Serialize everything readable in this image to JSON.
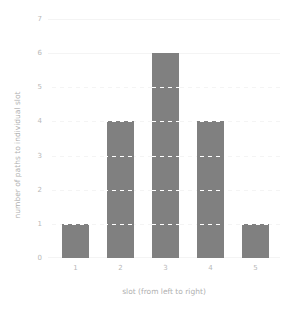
{
  "chart_data": {
    "type": "bar",
    "title": "",
    "subtitle": "",
    "categories": [
      "1",
      "2",
      "3",
      "4",
      "5"
    ],
    "values": [
      1,
      4,
      6,
      4,
      1
    ],
    "series": [
      {
        "name": "number of paths to individual slot",
        "values": [
          1,
          4,
          6,
          4,
          1
        ]
      }
    ],
    "xlabel": "slot (from left to right)",
    "ylabel": "number of paths to individual slot",
    "xtick_labels": [
      "1",
      "2",
      "3",
      "4",
      "5"
    ],
    "ytick_labels": [
      "0",
      "1",
      "2",
      "3",
      "4",
      "5",
      "6",
      "7"
    ],
    "ytick_values": [
      0,
      1,
      2,
      3,
      4,
      5,
      6,
      7
    ],
    "ylim": [
      0,
      7
    ],
    "grid": true,
    "grid_axis": "y",
    "grid_style": "dashed",
    "legend": false,
    "legend_position": "none",
    "annotations": [],
    "colors": {
      "bar": "#808080",
      "background": "#ffffff",
      "gridline": "#f4f4f4",
      "gridline_over_bar": "#ffffff",
      "tick_label": "#b8b8b8",
      "axis_label": "#b0b0b0"
    }
  }
}
